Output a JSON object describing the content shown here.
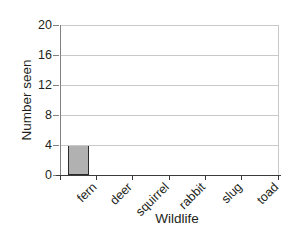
{
  "chart_data": {
    "type": "bar",
    "categories": [
      "fern",
      "deer",
      "squirrel",
      "rabbit",
      "slug",
      "toad"
    ],
    "values": [
      4,
      0,
      0,
      0,
      0,
      0
    ],
    "title": "",
    "xlabel": "Wildlife",
    "ylabel": "Number seen",
    "ylim": [
      0,
      20
    ],
    "yticks": [
      0,
      4,
      8,
      12,
      16,
      20
    ],
    "grid": "horizontal",
    "legend": "none",
    "bar_fill_color": "#b1b1b1",
    "bar_border_color": "#2a2a2a",
    "grid_color": "#c9c9c9",
    "x_axis_color": "#3a3a3a",
    "y_axis_color": "#808080",
    "text_color": "#231f20",
    "background_color": "#ffffff"
  }
}
